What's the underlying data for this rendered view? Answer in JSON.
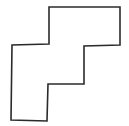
{
  "diagram": {
    "type": "polygon-outline",
    "shape": "staircase-polyomino",
    "stroke_color": "#2b2b2b",
    "fill_color": "#ffffff",
    "background_color": "#ffffff",
    "stroke_width": 1.6,
    "vertices": [
      [
        49,
        7
      ],
      [
        120,
        7
      ],
      [
        120,
        45
      ],
      [
        84,
        46
      ],
      [
        84,
        84
      ],
      [
        48,
        84
      ],
      [
        47,
        121
      ],
      [
        11,
        120
      ],
      [
        12,
        45
      ],
      [
        49,
        44
      ]
    ]
  }
}
